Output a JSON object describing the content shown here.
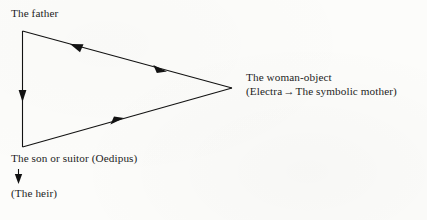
{
  "diagram": {
    "type": "triangle-flow",
    "background_color": "#fcfcfa",
    "stroke_color": "#121212",
    "labels": {
      "father": "The father",
      "son": "The son or suitor (Oedipus)",
      "heir": "(The heir)",
      "woman_line1": "The woman-object",
      "woman_line2_prefix": "(Electra",
      "woman_line2_arrow": "→",
      "woman_line2_suffix": "The symbolic mother)"
    },
    "nodes": [
      {
        "id": "father",
        "label": "The father",
        "x": 22,
        "y": 31
      },
      {
        "id": "son",
        "label": "The son or suitor (Oedipus)",
        "x": 22,
        "y": 147
      },
      {
        "id": "woman",
        "label": "The woman-object",
        "x": 232,
        "y": 88
      }
    ],
    "edges": [
      {
        "id": "father-to-son",
        "from": "father",
        "to": "son",
        "direction": "down",
        "arrowheads": 1
      },
      {
        "id": "father-woman",
        "from": "father",
        "to": "woman",
        "direction": "bidirectional",
        "arrowheads": 2
      },
      {
        "id": "son-to-woman",
        "from": "son",
        "to": "woman",
        "direction": "right",
        "arrowheads": 1
      }
    ],
    "standalone_arrow": {
      "id": "son-to-heir",
      "direction": "down",
      "x": 18,
      "y_start": 169,
      "y_end": 183
    }
  }
}
